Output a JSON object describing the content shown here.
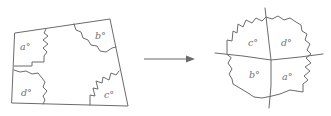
{
  "diagram": {
    "left_figure": {
      "shape": "quadrilateral",
      "corner_labels": {
        "top_left": "a°",
        "top_right": "b°",
        "bottom_right": "c°",
        "bottom_left": "d°"
      }
    },
    "arrow": {
      "direction": "right"
    },
    "right_figure": {
      "shape": "four torn corners meeting at a point",
      "quadrant_labels": {
        "top_left": "c°",
        "top_right": "d°",
        "bottom_left": "b°",
        "bottom_right": "a°"
      }
    },
    "colors": {
      "line": "#6b6b6b",
      "text": "#6f6f6f",
      "background": "#ffffff"
    }
  }
}
